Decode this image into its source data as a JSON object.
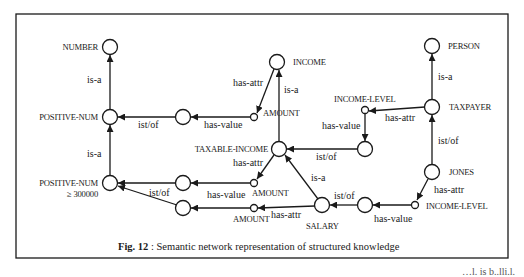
{
  "figure": {
    "caption_prefix": "Fig. 12",
    "caption_text": " : Semantic network representation of structured knowledge",
    "stray_text": "…l. is b..lli.l."
  },
  "nodes": {
    "number": "NUMBER",
    "positive_num": "POSITIVE-NUM",
    "positive_num_300000_line1": "POSITIVE-NUM",
    "positive_num_300000_line2": "≥ 300000",
    "income": "INCOME",
    "amount_top": "AMOUNT",
    "taxable_income": "TAXABLE-INCOME",
    "amount_mid": "AMOUNT",
    "amount_low": "AMOUNT",
    "salary": "SALARY",
    "person": "PERSON",
    "taxpayer": "TAXPAYER",
    "income_level_top": "INCOME-LEVEL",
    "jones": "JONES",
    "income_level_low": "INCOME-LEVEL"
  },
  "edges": {
    "number_isa": "is-a",
    "pos300_isa": "is-a",
    "pos_istof": "ist/of",
    "top_hasvalue": "has-value",
    "income_hasattr": "has-attr",
    "income_isa": "is-a",
    "taxable_hasattr": "has-attr",
    "taxable_istof": "ist/of",
    "pos300_istof": "ist/of",
    "mid_hasvalue": "has-value",
    "salary_isa": "is-a",
    "salary_hasattr": "has-attr",
    "salary_istof": "ist/of",
    "low_hasvalue": "has-value",
    "person_isa": "is-a",
    "taxpayer_hasattr": "has-attr",
    "il_hasvalue": "has-value",
    "taxpayer_istof": "ist/of",
    "jones_hasattr": "has-attr"
  },
  "colors": {
    "ink": "#1a1a1a",
    "background": "#ffffff"
  }
}
